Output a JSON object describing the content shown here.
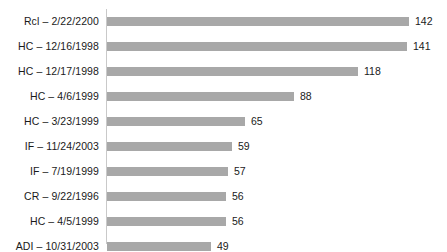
{
  "chart": {
    "title": "",
    "accent_color": "#a8a8a8",
    "axis_color": "#c9c9c9",
    "text_color": "#1a1a1a"
  },
  "chart_data": {
    "type": "bar",
    "orientation": "horizontal",
    "title": "",
    "subtitle": "",
    "xlabel": "",
    "ylabel": "",
    "xlim": [
      0,
      142
    ],
    "grid": false,
    "legend": null,
    "show_value_labels": true,
    "categories": [
      "Rcl – 2/22/2200",
      "HC – 12/16/1998",
      "HC – 12/17/1998",
      "HC – 4/6/1999",
      "HC – 3/23/1999",
      "IF – 11/24/2003",
      "IF – 7/19/1999",
      "CR – 9/22/1996",
      "HC – 4/5/1999",
      "ADI – 10/31/2003"
    ],
    "values": [
      142,
      141,
      118,
      88,
      65,
      59,
      57,
      56,
      56,
      49
    ],
    "value_labels": [
      "142",
      "141",
      "118",
      "88",
      "65",
      "59",
      "57",
      "56",
      "56",
      "49"
    ]
  }
}
